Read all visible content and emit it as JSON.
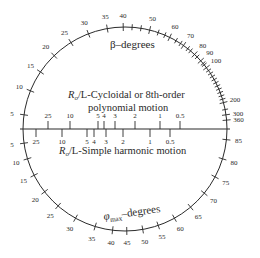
{
  "diagram": {
    "type": "circular-nomogram",
    "center": [
      125,
      129
    ],
    "radius": 102,
    "beta_scale": {
      "title": "β–degrees",
      "labels": [
        "5",
        "10",
        "15",
        "20",
        "25",
        "30",
        "35",
        "40",
        "50",
        "60",
        "70",
        "80",
        "90",
        "100",
        "200",
        "300",
        "360"
      ]
    },
    "phi_scale": {
      "title_symbol": "φ",
      "title_sub": "max",
      "title_rest": "–degrees",
      "labels": [
        "5",
        "10",
        "15",
        "20",
        "25",
        "30",
        "35",
        "40",
        "45",
        "50",
        "55",
        "60",
        "65",
        "70",
        "75",
        "80",
        "85"
      ]
    },
    "cycloidal_label": {
      "line1_italic": "R",
      "line1_sub": "o",
      "line1_rest": "/L-Cycloidal or 8th-order",
      "line2": "polynomial motion"
    },
    "harmonic_label": {
      "italic": "R",
      "sub": "o",
      "rest": "/L-Simple harmonic motion"
    },
    "upper_ro_l_ticks": [
      "25",
      "10",
      "5",
      "4",
      "3",
      "2",
      "1",
      "0.5"
    ],
    "lower_ro_l_ticks": [
      "25",
      "10",
      "5",
      "4",
      "3",
      "2",
      "1",
      "0.5"
    ]
  }
}
